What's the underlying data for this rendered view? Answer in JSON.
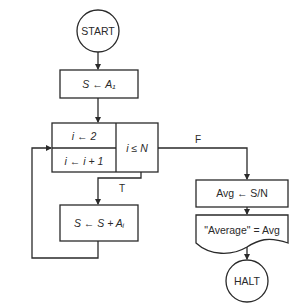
{
  "flowchart": {
    "start": {
      "label": "START"
    },
    "init_sum": {
      "label": "S ← A₁"
    },
    "loop": {
      "init": "i ← 2",
      "increment": "i ← i + 1",
      "condition": "i ≤ N"
    },
    "accumulate": {
      "label": "S ← S + Aᵢ"
    },
    "compute_avg": {
      "label": "Avg ← S/N"
    },
    "output": {
      "label": "\"Average\" = Avg"
    },
    "halt": {
      "label": "HALT"
    },
    "branches": {
      "true_label": "T",
      "false_label": "F"
    }
  },
  "colors": {
    "stroke": "#2a2a2a",
    "background": "#ffffff"
  }
}
